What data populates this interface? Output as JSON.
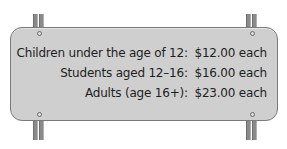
{
  "sign": {
    "background_color": "#cfcfcf",
    "border_color": "#7a7a7a",
    "lines": [
      {
        "label": "Children under the age of 12:",
        "price": "$12.00 each"
      },
      {
        "label": "Students aged 12–16:",
        "price": "$16.00 each"
      },
      {
        "label": "Adults (age 16+):",
        "price": "$23.00 each"
      }
    ]
  }
}
